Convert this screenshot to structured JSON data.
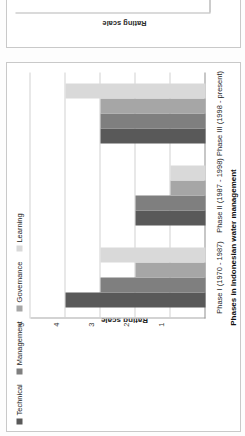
{
  "figure": {
    "top_partial_chart": {
      "ylabel": "Rating scale",
      "yticks": [
        "5",
        "4",
        "3",
        "2",
        "1"
      ],
      "note": "cropped chart above"
    }
  },
  "chart_data": {
    "type": "bar",
    "title": "",
    "xlabel": "Phases in Indonesian water management",
    "ylabel": "Rating scale",
    "ylim": [
      0,
      5
    ],
    "yticks": [
      1,
      2,
      3,
      4,
      5
    ],
    "grid": true,
    "legend_position": "top-left",
    "orientation": "rotated-90-ccw",
    "categories": [
      "Phase I (1970 - 1987)",
      "Phase II (1987 - 1998)",
      "Phase III (1998 - present)"
    ],
    "series": [
      {
        "name": "Technical",
        "color": "#595959",
        "values": [
          4,
          2,
          3
        ]
      },
      {
        "name": "Management",
        "color": "#7f7f7f",
        "values": [
          3,
          2,
          3
        ]
      },
      {
        "name": "Governance",
        "color": "#a6a6a6",
        "values": [
          2,
          1,
          3
        ]
      },
      {
        "name": "Learning",
        "color": "#d9d9d9",
        "values": [
          3,
          1,
          4
        ]
      }
    ]
  }
}
